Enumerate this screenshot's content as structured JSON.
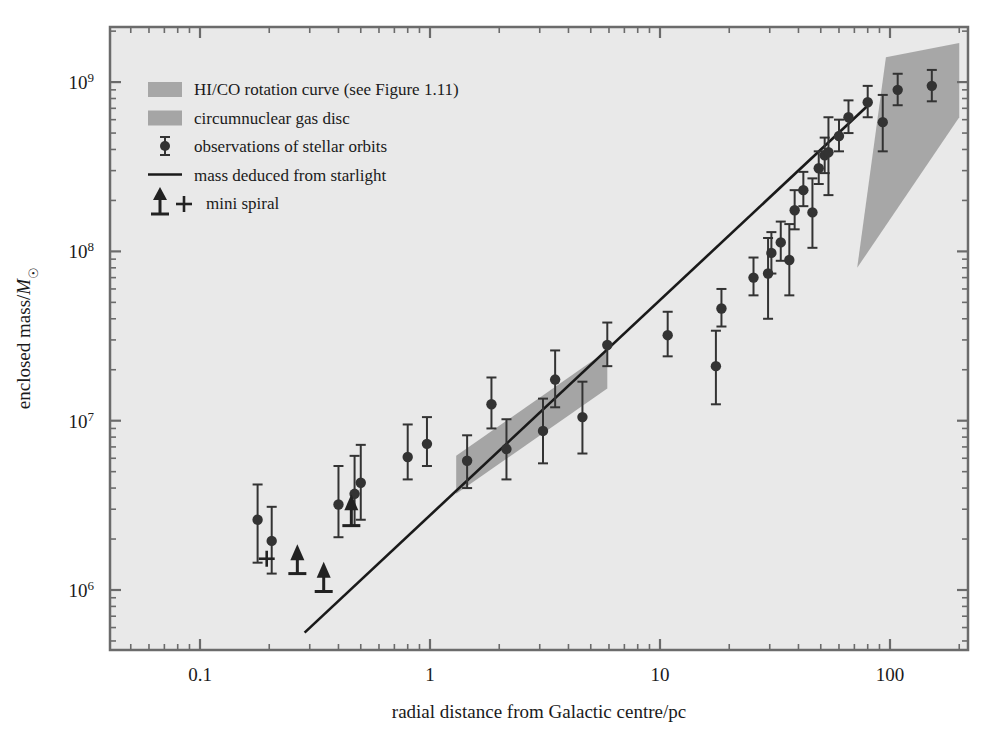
{
  "chart_data": {
    "type": "scatter",
    "title": "",
    "xlabel": "radial distance from Galactic centre/pc",
    "ylabel": "enclosed mass/M☉",
    "ylabel_prefix": "enclosed mass/",
    "ylabel_symbol": "M",
    "ylabel_subscript": "☉",
    "xscale": "log",
    "yscale": "log",
    "xlim": [
      0.05,
      200
    ],
    "ylim": [
      500000,
      2000000000
    ],
    "grid": false,
    "legend_position": "upper-left",
    "xticks": [
      {
        "value": 0.1,
        "label": "0.1"
      },
      {
        "value": 1,
        "label": "1"
      },
      {
        "value": 10,
        "label": "10"
      },
      {
        "value": 100,
        "label": "100"
      }
    ],
    "yticks": [
      {
        "value": 1000000,
        "label": "10",
        "exponent": "6"
      },
      {
        "value": 10000000,
        "label": "10",
        "exponent": "7"
      },
      {
        "value": 100000000,
        "label": "10",
        "exponent": "8"
      },
      {
        "value": 1000000000,
        "label": "10",
        "exponent": "9"
      }
    ],
    "series": [
      {
        "name": "observations of stellar orbits",
        "marker": "circle-errorbar",
        "color": "#333333",
        "points": [
          {
            "x": 0.178,
            "y": 2600000,
            "ylo": 1450000,
            "yhi": 4200000
          },
          {
            "x": 0.205,
            "y": 1950000,
            "ylo": 1250000,
            "yhi": 3100000
          },
          {
            "x": 0.4,
            "y": 3200000,
            "ylo": 2050000,
            "yhi": 5400000
          },
          {
            "x": 0.47,
            "y": 3700000,
            "ylo": 2400000,
            "yhi": 6200000
          },
          {
            "x": 0.5,
            "y": 4300000,
            "ylo": 2600000,
            "yhi": 7200000
          },
          {
            "x": 0.8,
            "y": 6100000,
            "ylo": 4500000,
            "yhi": 9500000
          },
          {
            "x": 0.97,
            "y": 7300000,
            "ylo": 5400000,
            "yhi": 10500000
          },
          {
            "x": 1.45,
            "y": 5800000,
            "ylo": 4000000,
            "yhi": 8200000
          },
          {
            "x": 1.85,
            "y": 12500000,
            "ylo": 9000000,
            "yhi": 18000000
          },
          {
            "x": 2.15,
            "y": 6800000,
            "ylo": 4500000,
            "yhi": 10200000
          },
          {
            "x": 3.1,
            "y": 8700000,
            "ylo": 5600000,
            "yhi": 13500000
          },
          {
            "x": 3.5,
            "y": 17500000,
            "ylo": 12000000,
            "yhi": 26000000
          },
          {
            "x": 4.6,
            "y": 10500000,
            "ylo": 6400000,
            "yhi": 17000000
          },
          {
            "x": 5.9,
            "y": 28000000,
            "ylo": 21000000,
            "yhi": 38000000
          },
          {
            "x": 10.8,
            "y": 32000000,
            "ylo": 24000000,
            "yhi": 44000000
          },
          {
            "x": 17.5,
            "y": 21000000,
            "ylo": 12500000,
            "yhi": 34000000
          },
          {
            "x": 18.5,
            "y": 46000000,
            "ylo": 36000000,
            "yhi": 60000000
          },
          {
            "x": 25.5,
            "y": 70000000,
            "ylo": 55000000,
            "yhi": 92000000
          },
          {
            "x": 29.5,
            "y": 74000000,
            "ylo": 40000000,
            "yhi": 120000000
          },
          {
            "x": 30.5,
            "y": 98000000,
            "ylo": 74000000,
            "yhi": 130000000
          },
          {
            "x": 33.5,
            "y": 113000000,
            "ylo": 88000000,
            "yhi": 150000000
          },
          {
            "x": 36.5,
            "y": 89000000,
            "ylo": 55000000,
            "yhi": 145000000
          },
          {
            "x": 38.5,
            "y": 175000000,
            "ylo": 135000000,
            "yhi": 230000000
          },
          {
            "x": 42.0,
            "y": 230000000,
            "ylo": 185000000,
            "yhi": 295000000
          },
          {
            "x": 46.0,
            "y": 170000000,
            "ylo": 105000000,
            "yhi": 270000000
          },
          {
            "x": 49.0,
            "y": 310000000,
            "ylo": 250000000,
            "yhi": 390000000
          },
          {
            "x": 52.0,
            "y": 370000000,
            "ylo": 290000000,
            "yhi": 470000000
          },
          {
            "x": 54.0,
            "y": 385000000,
            "ylo": 215000000,
            "yhi": 620000000
          },
          {
            "x": 60.0,
            "y": 480000000,
            "ylo": 390000000,
            "yhi": 600000000
          },
          {
            "x": 66.0,
            "y": 620000000,
            "ylo": 500000000,
            "yhi": 780000000
          },
          {
            "x": 80.0,
            "y": 760000000,
            "ylo": 620000000,
            "yhi": 950000000
          },
          {
            "x": 93.0,
            "y": 580000000,
            "ylo": 390000000,
            "yhi": 840000000
          },
          {
            "x": 108.0,
            "y": 900000000,
            "ylo": 730000000,
            "yhi": 1120000000
          },
          {
            "x": 152.0,
            "y": 950000000,
            "ylo": 770000000,
            "yhi": 1180000000
          }
        ]
      },
      {
        "name": "mini spiral",
        "marker": "arrow-up",
        "color": "#222222",
        "points": [
          {
            "x": 0.265,
            "y": 1650000,
            "ybase": 1250000
          },
          {
            "x": 0.345,
            "y": 1300000,
            "ybase": 980000
          },
          {
            "x": 0.455,
            "y": 3250000,
            "ybase": 2400000
          }
        ]
      },
      {
        "name": "mini spiral plus",
        "marker": "plus",
        "color": "#222222",
        "points": [
          {
            "x": 0.195,
            "y": 1530000
          }
        ]
      }
    ],
    "line": {
      "name": "mass deduced from starlight",
      "color": "#1a1a1a",
      "x_start": 0.285,
      "y_start": 560000,
      "x_end": 83.0,
      "y_end": 760000000
    },
    "bands": [
      {
        "name": "HI/CO rotation curve",
        "color": "#8d8d8d",
        "opacity": 0.72,
        "polygon": [
          [
            72,
            80000000
          ],
          [
            200,
            620000000
          ],
          [
            200,
            1700000000
          ],
          [
            96,
            1400000000
          ]
        ]
      },
      {
        "name": "circumnuclear gas disc",
        "color": "#7a7a7a",
        "opacity": 0.62,
        "polygon": [
          [
            1.3,
            3700000
          ],
          [
            5.9,
            15500000
          ],
          [
            5.9,
            26000000
          ],
          [
            1.3,
            6200000
          ]
        ]
      }
    ]
  },
  "legend": {
    "items": [
      {
        "label": "HI/CO rotation curve (see Figure 1.11)",
        "marker": "swatch",
        "color": "#8d8d8d"
      },
      {
        "label": "circumnuclear gas disc",
        "marker": "swatch",
        "color": "#7a7a7a"
      },
      {
        "label": "observations of stellar orbits",
        "marker": "circle-errorbar",
        "color": "#333333"
      },
      {
        "label": "mass deduced from starlight",
        "marker": "line",
        "color": "#1a1a1a"
      },
      {
        "label": "mini spiral",
        "marker": "arrow-plus",
        "color": "#222222"
      }
    ]
  },
  "figure": {
    "background": "#ffffff",
    "plot_background": "#e9e9e9",
    "frame_color": "#6b6b6b"
  }
}
